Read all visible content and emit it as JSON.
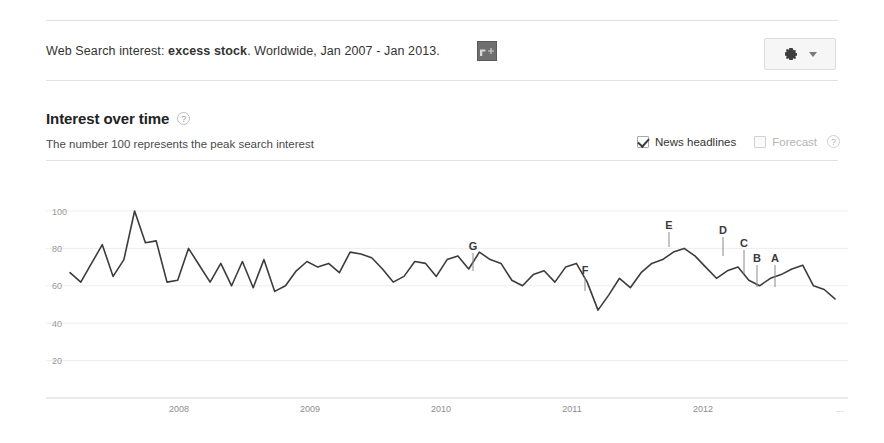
{
  "header": {
    "prefix": "Web Search interest: ",
    "term": "excess stock",
    "suffix": ". Worldwide, Jan 2007 - Jan 2013.",
    "share_icon": "google-share-thumbnail",
    "settings_icon": "gear-icon",
    "settings_caret": "chevron-down-icon"
  },
  "section": {
    "title": "Interest over time",
    "help_glyph": "?",
    "subtitle": "The number 100 represents the peak search interest"
  },
  "toggles": [
    {
      "label": "News headlines",
      "checked": true,
      "disabled": false,
      "help": false
    },
    {
      "label": "Forecast",
      "checked": false,
      "disabled": true,
      "help": true,
      "help_glyph": "?"
    }
  ],
  "chart_data": {
    "type": "line",
    "title": "Interest over time",
    "xlabel": "",
    "ylabel": "",
    "ylim": [
      0,
      108
    ],
    "yticks": [
      20,
      40,
      60,
      80,
      100
    ],
    "grid": true,
    "legend": "none",
    "xticks": [
      "2008",
      "2009",
      "2010",
      "2011",
      "2012"
    ],
    "xtick_positions": [
      179,
      310,
      441,
      572,
      703
    ],
    "x_start_label": "Jan 2007",
    "x_end_label": "Jan 2013",
    "overflow_marker": "...",
    "series": [
      {
        "name": "excess stock",
        "color": "#3c3c3c",
        "values": [
          67,
          62,
          72,
          82,
          65,
          74,
          100,
          83,
          84,
          62,
          63,
          80,
          71,
          62,
          72,
          60,
          73,
          59,
          74,
          57,
          60,
          68,
          73,
          70,
          72,
          67,
          78,
          77,
          75,
          69,
          62,
          65,
          73,
          72,
          65,
          74,
          76,
          69,
          78,
          74,
          72,
          63,
          60,
          66,
          68,
          62,
          70,
          72,
          62,
          47,
          55,
          64,
          59,
          67,
          72,
          74,
          78,
          80,
          76,
          70,
          64,
          68,
          70,
          63,
          60,
          64,
          66,
          69,
          71,
          60,
          58,
          53
        ]
      }
    ],
    "annotations": [
      {
        "label": "A",
        "x": 775,
        "y_label": 262,
        "y_point": 287
      },
      {
        "label": "B",
        "x": 757,
        "y_label": 262,
        "y_point": 287
      },
      {
        "label": "C",
        "x": 744,
        "y_label": 247,
        "y_point": 274
      },
      {
        "label": "D",
        "x": 723,
        "y_label": 234,
        "y_point": 256
      },
      {
        "label": "E",
        "x": 669,
        "y_label": 229,
        "y_point": 247
      },
      {
        "label": "F",
        "x": 585,
        "y_label": 274,
        "y_point": 291
      },
      {
        "label": "G",
        "x": 473,
        "y_label": 250,
        "y_point": 271
      }
    ]
  }
}
